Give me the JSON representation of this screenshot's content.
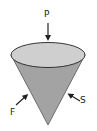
{
  "diagram": {
    "colors": {
      "top_face": "#cfcfcf",
      "body": "#a3a3a3",
      "outline": "#333333",
      "arrow": "#222222"
    },
    "forces": [
      {
        "label": "P",
        "direction": "downward onto top face"
      },
      {
        "label": "F",
        "direction": "up-right onto left side"
      },
      {
        "label": "S",
        "direction": "up-left onto right side"
      }
    ]
  }
}
